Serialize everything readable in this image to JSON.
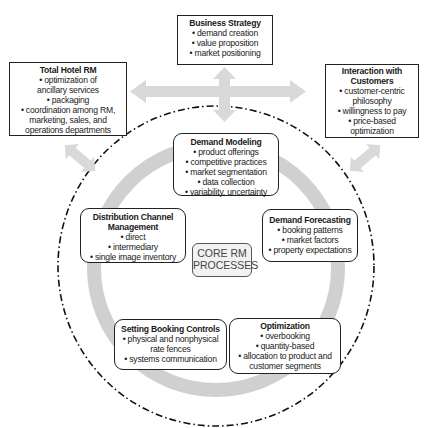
{
  "outer_boxes": {
    "business_strategy": {
      "title": "Business Strategy",
      "items": [
        "• demand creation",
        "• value proposition",
        "• market positioning"
      ]
    },
    "total_hotel_rm": {
      "title": "Total Hotel RM",
      "items": [
        "• optimization of",
        "ancillary services",
        "• packaging",
        "• coordination among RM,",
        "marketing, sales, and",
        "operations departments"
      ]
    },
    "interaction_with_customers": {
      "title_lines": [
        "Interaction with",
        "Customers"
      ],
      "items": [
        "• customer-centric",
        "philosophy",
        "• willingness to pay",
        "• price-based",
        "optimization"
      ]
    }
  },
  "core_processes": {
    "center_label": [
      "CORE RM",
      "PROCESSES"
    ],
    "demand_modeling": {
      "title": "Demand Modeling",
      "items": [
        "• product offerings",
        "• competitive practices",
        "• market segmentation",
        "• data collection",
        "• variability, uncertainty"
      ]
    },
    "demand_forecasting": {
      "title": "Demand Forecasting",
      "items": [
        "• booking patterns",
        "• market factors",
        "• property expectations"
      ]
    },
    "optimization": {
      "title": "Optimization",
      "items": [
        "• overbooking",
        "• quantity-based",
        "• allocation to product and",
        "customer segments"
      ]
    },
    "setting_booking_controls": {
      "title": "Setting Booking Controls",
      "items": [
        "• physical and nonphysical",
        "rate fences",
        "• systems communication"
      ]
    },
    "distribution_channel_management": {
      "title_lines": [
        "Distribution Channel",
        "Management"
      ],
      "items": [
        "• direct",
        "• intermediary",
        "• single image inventory"
      ]
    }
  },
  "colors": {
    "arrow_gray": "#d6d6d6",
    "cycle_gray": "#cfcfcf",
    "border": "#222222"
  }
}
